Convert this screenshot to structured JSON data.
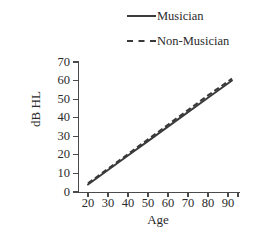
{
  "chart_data": {
    "type": "line",
    "title": "",
    "xlabel": "Age",
    "ylabel": "dB HL",
    "xlim": [
      15,
      95
    ],
    "ylim": [
      0,
      70
    ],
    "xticks": [
      20,
      30,
      40,
      50,
      60,
      70,
      80,
      90
    ],
    "yticks": [
      0,
      10,
      20,
      30,
      40,
      50,
      60,
      70
    ],
    "xtick_labels": [
      "20",
      "30",
      "40",
      "50",
      "60",
      "70",
      "80",
      "90"
    ],
    "ytick_labels": [
      "0",
      "10",
      "20",
      "30",
      "40",
      "50",
      "60",
      "70"
    ],
    "grid": false,
    "legend_position": "top",
    "series": [
      {
        "name": "Musician",
        "style": "solid",
        "color": "#3a3a3a",
        "x": [
          20,
          30,
          40,
          50,
          60,
          70,
          80,
          92
        ],
        "values": [
          4,
          11.8,
          19.6,
          27.4,
          35.2,
          43,
          50.8,
          60
        ]
      },
      {
        "name": "Non-Musician",
        "style": "dashed",
        "color": "#3a3a3a",
        "x": [
          20,
          30,
          40,
          50,
          60,
          70,
          80,
          92
        ],
        "values": [
          4.6,
          12.5,
          20.4,
          28.3,
          36.2,
          44.1,
          52,
          61
        ]
      }
    ]
  },
  "legend": {
    "entries": [
      {
        "label": "Musician",
        "style": "solid",
        "sample_name": "legend-line-solid"
      },
      {
        "label": "Non-Musician",
        "style": "dashed",
        "sample_name": "legend-line-dashed"
      }
    ]
  },
  "axes": {
    "x_axis_label": "Age",
    "y_axis_label": "dB HL"
  }
}
